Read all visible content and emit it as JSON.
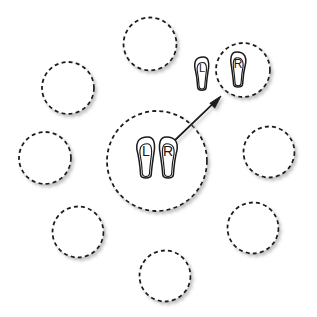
{
  "diagram": {
    "canvas": {
      "width": 317,
      "height": 317,
      "background": "#ffffff"
    },
    "style": {
      "stroke_color": "#1a1a1a",
      "dash_pattern": "4 3.2",
      "circle_stroke_width": 1.8,
      "footprint_stroke_width": 1.5,
      "arrow_stroke_width": 1.8,
      "shadow_color": "#b8b8b8",
      "fill_color": "#ffffff",
      "label_color": "#1a1a1a"
    },
    "circles": [
      {
        "id": "circle-top-center",
        "name": "dashed-circle-top-center",
        "cx": 150,
        "cy": 44,
        "r": 26.5,
        "occupied": false,
        "highlight": false
      },
      {
        "id": "circle-top-left",
        "name": "dashed-circle-top-left",
        "cx": 68,
        "cy": 88,
        "r": 26.0,
        "occupied": false,
        "highlight": false
      },
      {
        "id": "circle-target",
        "name": "dashed-circle-target",
        "cx": 243,
        "cy": 70,
        "r": 27.0,
        "occupied": true,
        "highlight": true
      },
      {
        "id": "circle-mid-left",
        "name": "dashed-circle-mid-left",
        "cx": 45,
        "cy": 158,
        "r": 26.0,
        "occupied": false,
        "highlight": false
      },
      {
        "id": "circle-center",
        "name": "dashed-circle-center-source",
        "cx": 157,
        "cy": 161,
        "r": 50.0,
        "occupied": true,
        "highlight": false
      },
      {
        "id": "circle-mid-right",
        "name": "dashed-circle-mid-right",
        "cx": 269,
        "cy": 152,
        "r": 25.5,
        "occupied": false,
        "highlight": false
      },
      {
        "id": "circle-bottom-left",
        "name": "dashed-circle-bottom-left",
        "cx": 78,
        "cy": 232,
        "r": 25.5,
        "occupied": false,
        "highlight": false
      },
      {
        "id": "circle-bottom-right",
        "name": "dashed-circle-bottom-right",
        "cx": 253,
        "cy": 228,
        "r": 25.5,
        "occupied": false,
        "highlight": false
      },
      {
        "id": "circle-bottom-center",
        "name": "dashed-circle-bottom-center",
        "cx": 165,
        "cy": 276,
        "r": 25.5,
        "occupied": false,
        "highlight": false
      }
    ],
    "footprints": [
      {
        "id": "foot-center-left",
        "name": "footprint-left-center",
        "label": "L",
        "side": "left",
        "cx": 146,
        "cy": 158,
        "w": 19,
        "h": 42,
        "rotation": 0,
        "in_circle": "circle-center"
      },
      {
        "id": "foot-center-right",
        "name": "footprint-right-center",
        "label": "R",
        "side": "right",
        "cx": 168,
        "cy": 158,
        "w": 19,
        "h": 42,
        "rotation": 0,
        "in_circle": "circle-center"
      },
      {
        "id": "foot-target-left",
        "name": "footprint-left-target",
        "label": "L",
        "side": "left",
        "cx": 202,
        "cy": 74,
        "w": 15,
        "h": 34,
        "rotation": 0,
        "in_circle": null
      },
      {
        "id": "foot-target-right",
        "name": "footprint-right-target",
        "label": "R",
        "side": "right",
        "cx": 238,
        "cy": 70,
        "w": 16,
        "h": 36,
        "rotation": 0,
        "in_circle": "circle-target"
      }
    ],
    "arrow": {
      "name": "transfer-arrow",
      "from_x": 171,
      "from_y": 144,
      "to_x": 221,
      "to_y": 96,
      "head_length": 13,
      "head_width": 9
    },
    "labels": {
      "left_foot": "L",
      "right_foot": "R"
    }
  }
}
